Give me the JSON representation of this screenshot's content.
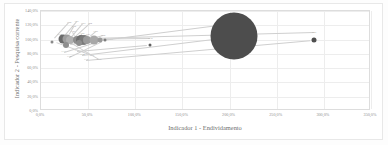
{
  "chart_data": {
    "type": "scatter",
    "title": "",
    "xlabel": "Indicador 1 - Endividamento",
    "ylabel": "Indicador 2 - Pesquisa corrente",
    "xlim": [
      0,
      350
    ],
    "ylim": [
      0,
      140
    ],
    "xticks": [
      "0,0%",
      "50,0%",
      "100,0%",
      "150,0%",
      "200,0%",
      "250,0%",
      "300,0%",
      "350,0%"
    ],
    "xtick_values": [
      0,
      50,
      100,
      150,
      200,
      250,
      300,
      350
    ],
    "yticks": [
      "0,0%",
      "20,0%",
      "40,0%",
      "60,0%",
      "80,0%",
      "100,0%",
      "120,0%",
      "140,0%"
    ],
    "ytick_values": [
      0,
      20,
      40,
      60,
      80,
      100,
      120,
      140
    ],
    "grid": true,
    "legend": "none",
    "series": [
      {
        "name": "Empresas",
        "points": [
          {
            "label": "E1",
            "x": 12,
            "y": 97,
            "size": 3,
            "color": "#8a8a8a"
          },
          {
            "label": "E2",
            "x": 23,
            "y": 101,
            "size": 9,
            "color": "#6b6b6b"
          },
          {
            "label": "E3",
            "x": 28,
            "y": 101,
            "size": 9,
            "color": "#9d9d9d"
          },
          {
            "label": "E4",
            "x": 31,
            "y": 100,
            "size": 8,
            "color": "#b0b0b0"
          },
          {
            "label": "E5",
            "x": 27,
            "y": 92,
            "size": 6,
            "color": "#8e8e8e"
          },
          {
            "label": "E6",
            "x": 38,
            "y": 100,
            "size": 8,
            "color": "#8e8e8e"
          },
          {
            "label": "E7",
            "x": 42,
            "y": 100,
            "size": 10,
            "color": "#6e6e6e"
          },
          {
            "label": "E8",
            "x": 46,
            "y": 100,
            "size": 10,
            "color": "#7a7a7a"
          },
          {
            "label": "E9",
            "x": 49,
            "y": 100,
            "size": 8,
            "color": "#9b9b9b"
          },
          {
            "label": "E10",
            "x": 40,
            "y": 95,
            "size": 6,
            "color": "#8f8f8f"
          },
          {
            "label": "E11",
            "x": 56,
            "y": 100,
            "size": 9,
            "color": "#a8a8a8"
          },
          {
            "label": "E12",
            "x": 63,
            "y": 99,
            "size": 5,
            "color": "#9a9a9a"
          },
          {
            "label": "E13",
            "x": 68,
            "y": 99,
            "size": 3,
            "color": "#7d7d7d"
          },
          {
            "label": "E14",
            "x": 116,
            "y": 93,
            "size": 3,
            "color": "#5f5f5f"
          },
          {
            "label": "E15",
            "x": 205,
            "y": 105,
            "size": 47,
            "color": "#4d4d4d"
          },
          {
            "label": "E16",
            "x": 290,
            "y": 100,
            "size": 5,
            "color": "#4f4f4f"
          }
        ]
      }
    ],
    "callout_labels": [
      {
        "text": "E20",
        "x": 30,
        "y": 123
      },
      {
        "text": "E21",
        "x": 38,
        "y": 124
      },
      {
        "text": "E22",
        "x": 35,
        "y": 117
      },
      {
        "text": "E23",
        "x": 45,
        "y": 122
      },
      {
        "text": "E24",
        "x": 52,
        "y": 122
      },
      {
        "text": "E25",
        "x": 34,
        "y": 110
      },
      {
        "text": "E26",
        "x": 44,
        "y": 108
      },
      {
        "text": "E27",
        "x": 50,
        "y": 107
      },
      {
        "text": "E28",
        "x": 58,
        "y": 110
      },
      {
        "text": "E29",
        "x": 66,
        "y": 105
      },
      {
        "text": "E30",
        "x": 20,
        "y": 107
      },
      {
        "text": "E31",
        "x": 24,
        "y": 83
      },
      {
        "text": "E32",
        "x": 30,
        "y": 75
      },
      {
        "text": "E33",
        "x": 38,
        "y": 84
      },
      {
        "text": "E34",
        "x": 44,
        "y": 79
      },
      {
        "text": "E35",
        "x": 48,
        "y": 72
      },
      {
        "text": "E36",
        "x": 54,
        "y": 77
      },
      {
        "text": "E37",
        "x": 62,
        "y": 71
      },
      {
        "text": "E38",
        "x": 74,
        "y": 99
      },
      {
        "text": "E39",
        "x": 116,
        "y": 101
      },
      {
        "text": "E40",
        "x": 205,
        "y": 122
      },
      {
        "text": "E41",
        "x": 290,
        "y": 109
      }
    ]
  }
}
